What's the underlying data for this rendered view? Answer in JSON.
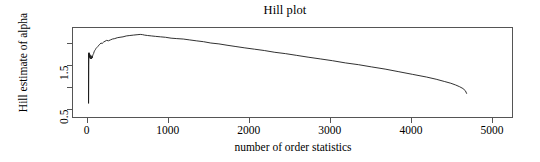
{
  "chart_data": {
    "type": "line",
    "title": "Hill plot",
    "xlabel": "number of order statistics",
    "ylabel": "Hill estimate of alpha",
    "xlim": [
      -180,
      5260
    ],
    "ylim": [
      0.3,
      2.36
    ],
    "grid": false,
    "legend": null,
    "xticks": [
      0,
      1000,
      2000,
      3000,
      4000,
      5000
    ],
    "xticklabels": [
      "0",
      "1000",
      "2000",
      "3000",
      "4000",
      "5000"
    ],
    "yticks": [
      0.5,
      1.0,
      1.5,
      2.0
    ],
    "yticklabels": [
      "0.5",
      "",
      "1.5",
      ""
    ],
    "line_color": "#1a1a1a",
    "axis_color": "#555555",
    "background": "#ffffff",
    "series": [
      {
        "name": "Hill estimate",
        "x": [
          12,
          14,
          16,
          18,
          20,
          22,
          25,
          28,
          31,
          34,
          37,
          40,
          44,
          48,
          52,
          57,
          62,
          68,
          74,
          80,
          88,
          96,
          105,
          115,
          126,
          138,
          151,
          165,
          180,
          197,
          215,
          235,
          257,
          281,
          307,
          335,
          366,
          400,
          437,
          477,
          521,
          569,
          621,
          650,
          678,
          700,
          740,
          790,
          840,
          900,
          960,
          1030,
          1100,
          1180,
          1260,
          1340,
          1430,
          1520,
          1620,
          1720,
          1830,
          1940,
          2060,
          2180,
          2310,
          2440,
          2580,
          2720,
          2870,
          3020,
          3180,
          3340,
          3500,
          3670,
          3840,
          4010,
          4180,
          4300,
          4400,
          4480,
          4540,
          4590,
          4630,
          4660,
          4675
        ],
        "y": [
          0.66,
          1.52,
          1.78,
          1.7,
          1.8,
          1.74,
          1.69,
          1.76,
          1.72,
          1.66,
          1.7,
          1.74,
          1.7,
          1.66,
          1.72,
          1.68,
          1.73,
          1.76,
          1.78,
          1.82,
          1.85,
          1.87,
          1.9,
          1.92,
          1.94,
          1.97,
          1.99,
          2.02,
          2.01,
          2.04,
          2.06,
          2.08,
          2.07,
          2.09,
          2.11,
          2.12,
          2.14,
          2.15,
          2.16,
          2.18,
          2.19,
          2.2,
          2.21,
          2.215,
          2.21,
          2.2,
          2.19,
          2.18,
          2.17,
          2.16,
          2.15,
          2.13,
          2.12,
          2.11,
          2.09,
          2.07,
          2.05,
          2.02,
          2.0,
          1.97,
          1.94,
          1.91,
          1.88,
          1.85,
          1.81,
          1.78,
          1.74,
          1.7,
          1.66,
          1.62,
          1.57,
          1.53,
          1.48,
          1.43,
          1.37,
          1.31,
          1.25,
          1.2,
          1.15,
          1.11,
          1.07,
          1.03,
          0.99,
          0.94,
          0.88
        ],
        "initial_spike": {
          "x": 12,
          "y_low": 0.655,
          "y_high": 1.8,
          "note": "vertical spike at smallest order statistics"
        },
        "peak": {
          "x": 650,
          "y": 2.215
        },
        "tail_drop": {
          "x_start": 4540,
          "x_end": 4675,
          "y_start": 1.11,
          "y_end": 0.72
        }
      }
    ]
  },
  "axis": {
    "xticklabels": [
      "0",
      "1000",
      "2000",
      "3000",
      "4000",
      "5000"
    ],
    "yticklabels": [
      "0.5",
      "",
      "1.5",
      ""
    ]
  }
}
